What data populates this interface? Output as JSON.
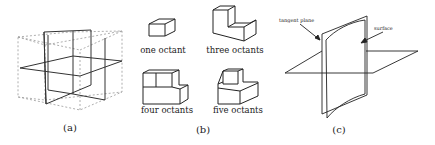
{
  "figure": {
    "panels": [
      {
        "id": "a",
        "caption": "(a)",
        "description": "three orthogonal planes dividing a cube into octants"
      },
      {
        "id": "b",
        "caption": "(b)",
        "octant_labels": [
          "one octant",
          "three octants",
          "four octants",
          "five octants"
        ]
      },
      {
        "id": "c",
        "caption": "(c)",
        "annotations": [
          "tangent plane",
          "surface"
        ]
      }
    ],
    "colors": {
      "stroke": "#222222",
      "dashed": "#9a9a9a",
      "background": "#ffffff"
    }
  }
}
